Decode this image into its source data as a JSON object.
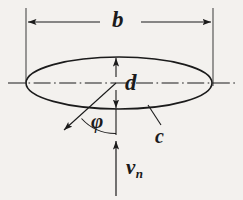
{
  "figure": {
    "background_color": "#f3f1ee",
    "ink_color": "#1b1b1b",
    "labels": {
      "major_axis": "b",
      "minor_axis": "d",
      "angle": "φ",
      "contour": "c",
      "velocity": "v",
      "velocity_subscript": "n"
    }
  },
  "geometry": {
    "ellipse": {
      "center_x": 119,
      "center_y": 83,
      "semi_major": 93,
      "semi_minor": 26
    },
    "dimension_b": {
      "y": 22,
      "x_start": 26,
      "x_end": 213,
      "extension_top": 8
    },
    "dimension_d": {
      "x": 116,
      "y_top": 57,
      "y_bottom": 109
    },
    "angle_phi_degrees": 42,
    "velocity_arrow": {
      "x": 116,
      "y_tail": 196,
      "y_head": 140
    },
    "leader_c": {
      "x_start": 148,
      "y_start": 106,
      "x_end": 161,
      "y_end": 125
    }
  }
}
